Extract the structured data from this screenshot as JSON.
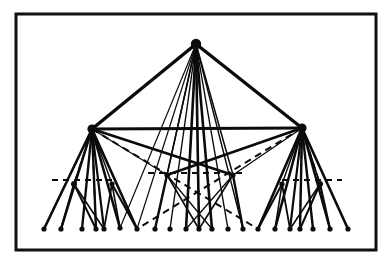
{
  "figure": {
    "type": "node-link-tree",
    "background_color": "#ffffff",
    "ink_color": "#0b0b0b",
    "frame": {
      "x": 16,
      "y": 14,
      "width": 360,
      "height": 236,
      "stroke_width": 3,
      "stroke_color": "#111111"
    },
    "canvas": {
      "width": 391,
      "height": 267
    }
  },
  "chart_data": {
    "type": "network",
    "title": "",
    "xlabel": "",
    "ylabel": "",
    "legend": [],
    "levels": [
      {
        "name": "root",
        "y": 44,
        "count": 1
      },
      {
        "name": "hubs",
        "y": 128,
        "count": 2
      },
      {
        "name": "midpoints",
        "y": 180,
        "count": 5
      },
      {
        "name": "leaves",
        "y": 228,
        "count": 21
      }
    ],
    "nodes": [
      {
        "id": "root",
        "label": "root",
        "x": 196,
        "y": 44,
        "r": 5.2,
        "level": "root"
      },
      {
        "id": "hubL",
        "label": "hub-left",
        "x": 92,
        "y": 129,
        "r": 4.6,
        "level": "hubs"
      },
      {
        "id": "hubR",
        "label": "hub-right",
        "x": 302,
        "y": 128,
        "r": 4.6,
        "level": "hubs"
      },
      {
        "id": "mL",
        "label": "mid-left",
        "x": 74,
        "y": 184,
        "r": 3.0,
        "level": "midpoints"
      },
      {
        "id": "mLR",
        "label": "mid-left-right",
        "x": 112,
        "y": 184,
        "r": 2.6,
        "level": "midpoints"
      },
      {
        "id": "mCL",
        "label": "mid-center-left",
        "x": 167,
        "y": 175,
        "r": 2.6,
        "level": "midpoints"
      },
      {
        "id": "mCR",
        "label": "mid-center-right",
        "x": 233,
        "y": 175,
        "r": 2.6,
        "level": "midpoints"
      },
      {
        "id": "mR",
        "label": "mid-right",
        "x": 320,
        "y": 184,
        "r": 3.0,
        "level": "midpoints"
      },
      {
        "id": "mRL",
        "label": "mid-right-left",
        "x": 282,
        "y": 184,
        "r": 2.6,
        "level": "midpoints"
      },
      {
        "id": "l01",
        "label": "leaf-01",
        "x": 44,
        "y": 229,
        "r": 2.6,
        "level": "leaves"
      },
      {
        "id": "l02",
        "label": "leaf-02",
        "x": 61,
        "y": 229,
        "r": 2.6,
        "level": "leaves"
      },
      {
        "id": "l03",
        "label": "leaf-03",
        "x": 82,
        "y": 229,
        "r": 2.6,
        "level": "leaves"
      },
      {
        "id": "l04",
        "label": "leaf-04",
        "x": 96,
        "y": 229,
        "r": 2.6,
        "level": "leaves"
      },
      {
        "id": "l05",
        "label": "leaf-05",
        "x": 104,
        "y": 229,
        "r": 2.6,
        "level": "leaves"
      },
      {
        "id": "l06",
        "label": "leaf-06",
        "x": 120,
        "y": 228,
        "r": 2.6,
        "level": "leaves"
      },
      {
        "id": "l07",
        "label": "leaf-07",
        "x": 137,
        "y": 229,
        "r": 2.6,
        "level": "leaves"
      },
      {
        "id": "l08",
        "label": "leaf-08",
        "x": 155,
        "y": 229,
        "r": 2.6,
        "level": "leaves"
      },
      {
        "id": "l09",
        "label": "leaf-09",
        "x": 170,
        "y": 229,
        "r": 2.6,
        "level": "leaves"
      },
      {
        "id": "l10",
        "label": "leaf-10",
        "x": 186,
        "y": 229,
        "r": 2.6,
        "level": "leaves"
      },
      {
        "id": "l11",
        "label": "leaf-11",
        "x": 199,
        "y": 229,
        "r": 2.6,
        "level": "leaves"
      },
      {
        "id": "l12",
        "label": "leaf-12",
        "x": 212,
        "y": 229,
        "r": 2.6,
        "level": "leaves"
      },
      {
        "id": "l13",
        "label": "leaf-13",
        "x": 228,
        "y": 229,
        "r": 2.6,
        "level": "leaves"
      },
      {
        "id": "l14",
        "label": "leaf-14",
        "x": 243,
        "y": 229,
        "r": 2.6,
        "level": "leaves"
      },
      {
        "id": "l15",
        "label": "leaf-15",
        "x": 258,
        "y": 229,
        "r": 2.6,
        "level": "leaves"
      },
      {
        "id": "l16",
        "label": "leaf-16",
        "x": 275,
        "y": 229,
        "r": 2.6,
        "level": "leaves"
      },
      {
        "id": "l17",
        "label": "leaf-17",
        "x": 290,
        "y": 229,
        "r": 2.6,
        "level": "leaves"
      },
      {
        "id": "l18",
        "label": "leaf-18",
        "x": 300,
        "y": 229,
        "r": 2.6,
        "level": "leaves"
      },
      {
        "id": "l19",
        "label": "leaf-19",
        "x": 313,
        "y": 229,
        "r": 2.6,
        "level": "leaves"
      },
      {
        "id": "l20",
        "label": "leaf-20",
        "x": 330,
        "y": 229,
        "r": 2.6,
        "level": "leaves"
      },
      {
        "id": "l21",
        "label": "leaf-21",
        "x": 348,
        "y": 229,
        "r": 2.6,
        "level": "leaves"
      }
    ],
    "edges": [
      {
        "from": "root",
        "to": "hubL",
        "style": "solid",
        "width": 3.4
      },
      {
        "from": "root",
        "to": "hubR",
        "style": "solid",
        "width": 3.4
      },
      {
        "from": "hubL",
        "to": "hubR",
        "style": "solid",
        "width": 3.0
      },
      {
        "from": "root",
        "to": "mCL",
        "style": "solid",
        "width": 1.5
      },
      {
        "from": "root",
        "to": "mCR",
        "style": "solid",
        "width": 1.5
      },
      {
        "from": "root",
        "to": "l08",
        "style": "solid",
        "width": 1.4
      },
      {
        "from": "root",
        "to": "l09",
        "style": "solid",
        "width": 1.4
      },
      {
        "from": "root",
        "to": "l10",
        "style": "solid",
        "width": 2.6
      },
      {
        "from": "root",
        "to": "l11",
        "style": "solid",
        "width": 2.6
      },
      {
        "from": "root",
        "to": "l12",
        "style": "solid",
        "width": 2.6
      },
      {
        "from": "root",
        "to": "l13",
        "style": "solid",
        "width": 1.4
      },
      {
        "from": "root",
        "to": "l14",
        "style": "solid",
        "width": 1.4
      },
      {
        "from": "root",
        "to": "l06",
        "style": "solid",
        "width": 1.2
      },
      {
        "from": "root",
        "to": "l07",
        "style": "solid",
        "width": 1.2
      },
      {
        "from": "hubL",
        "to": "mCR",
        "style": "solid",
        "width": 2.6
      },
      {
        "from": "hubR",
        "to": "mCL",
        "style": "solid",
        "width": 2.6
      },
      {
        "from": "hubL",
        "to": "mCL",
        "style": "solid",
        "width": 1.3
      },
      {
        "from": "hubR",
        "to": "mCR",
        "style": "solid",
        "width": 1.3
      },
      {
        "from": "hubL",
        "to": "l01",
        "style": "solid",
        "width": 2.6
      },
      {
        "from": "hubL",
        "to": "l02",
        "style": "solid",
        "width": 2.4
      },
      {
        "from": "hubL",
        "to": "l03",
        "style": "solid",
        "width": 2.4
      },
      {
        "from": "hubL",
        "to": "l04",
        "style": "solid",
        "width": 2.4
      },
      {
        "from": "hubL",
        "to": "l05",
        "style": "solid",
        "width": 2.2
      },
      {
        "from": "hubL",
        "to": "l06",
        "style": "solid",
        "width": 2.6
      },
      {
        "from": "hubL",
        "to": "l07",
        "style": "solid",
        "width": 2.6
      },
      {
        "from": "hubL",
        "to": "mL",
        "style": "solid",
        "width": 1.6
      },
      {
        "from": "hubL",
        "to": "mLR",
        "style": "solid",
        "width": 1.4
      },
      {
        "from": "hubR",
        "to": "l21",
        "style": "solid",
        "width": 2.6
      },
      {
        "from": "hubR",
        "to": "l20",
        "style": "solid",
        "width": 2.4
      },
      {
        "from": "hubR",
        "to": "l19",
        "style": "solid",
        "width": 2.4
      },
      {
        "from": "hubR",
        "to": "l18",
        "style": "solid",
        "width": 2.4
      },
      {
        "from": "hubR",
        "to": "l17",
        "style": "solid",
        "width": 2.2
      },
      {
        "from": "hubR",
        "to": "l16",
        "style": "solid",
        "width": 2.6
      },
      {
        "from": "hubR",
        "to": "l15",
        "style": "solid",
        "width": 2.6
      },
      {
        "from": "hubR",
        "to": "mR",
        "style": "solid",
        "width": 1.6
      },
      {
        "from": "hubR",
        "to": "mRL",
        "style": "solid",
        "width": 1.4
      },
      {
        "from": "mL",
        "to": "l02",
        "style": "solid",
        "width": 2.2
      },
      {
        "from": "mL",
        "to": "l04",
        "style": "solid",
        "width": 2.0
      },
      {
        "from": "mL",
        "to": "l05",
        "style": "solid",
        "width": 1.6
      },
      {
        "from": "mLR",
        "to": "l05",
        "style": "solid",
        "width": 1.8
      },
      {
        "from": "mLR",
        "to": "l06",
        "style": "solid",
        "width": 1.6
      },
      {
        "from": "mLR",
        "to": "l07",
        "style": "solid",
        "width": 2.0
      },
      {
        "from": "mR",
        "to": "l20",
        "style": "solid",
        "width": 2.2
      },
      {
        "from": "mR",
        "to": "l18",
        "style": "solid",
        "width": 2.0
      },
      {
        "from": "mR",
        "to": "l17",
        "style": "solid",
        "width": 1.6
      },
      {
        "from": "mRL",
        "to": "l17",
        "style": "solid",
        "width": 1.8
      },
      {
        "from": "mRL",
        "to": "l16",
        "style": "solid",
        "width": 1.6
      },
      {
        "from": "mRL",
        "to": "l15",
        "style": "solid",
        "width": 2.0
      },
      {
        "from": "mCL",
        "to": "l08",
        "style": "solid",
        "width": 2.4
      },
      {
        "from": "mCL",
        "to": "l11",
        "style": "solid",
        "width": 1.6
      },
      {
        "from": "mCR",
        "to": "l14",
        "style": "solid",
        "width": 2.4
      },
      {
        "from": "mCR",
        "to": "l11",
        "style": "solid",
        "width": 1.6
      },
      {
        "from": "mCL",
        "to": "l12",
        "style": "solid",
        "width": 1.3
      },
      {
        "from": "mCR",
        "to": "l10",
        "style": "solid",
        "width": 1.3
      },
      {
        "from": "hubL",
        "to": "l15",
        "style": "dashed",
        "width": 2.0
      },
      {
        "from": "hubR",
        "to": "l07",
        "style": "dashed",
        "width": 2.0
      },
      {
        "from": "hubL",
        "to": "mL",
        "style": "dashed",
        "width": 1.6
      },
      {
        "from": "hubR",
        "to": "mR",
        "style": "dashed",
        "width": 1.6
      },
      {
        "from": "hubL",
        "to": "l04",
        "style": "dashed",
        "width": 1.6
      },
      {
        "from": "hubR",
        "to": "l18",
        "style": "dashed",
        "width": 1.6
      }
    ],
    "dashed_rails": [
      {
        "name": "rail-left",
        "x1": 52,
        "x2": 112,
        "y": 180,
        "width": 2.0
      },
      {
        "name": "rail-center",
        "x1": 148,
        "x2": 246,
        "y": 173,
        "width": 2.0
      },
      {
        "name": "rail-right",
        "x1": 282,
        "x2": 342,
        "y": 180,
        "width": 2.0
      }
    ]
  }
}
